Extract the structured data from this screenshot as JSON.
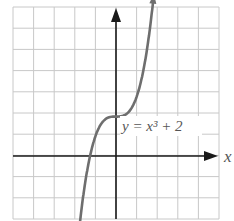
{
  "chart_data": {
    "type": "line",
    "title": "",
    "xlabel": "x",
    "ylabel": "",
    "equation_label": "y = x³ + 2",
    "grid": true,
    "xlim": [
      -5,
      5
    ],
    "ylim": [
      -3,
      7
    ],
    "series": [
      {
        "name": "y = x^3 + 2",
        "x": [
          -1.95,
          -1.5,
          -1.26,
          -1.0,
          -0.5,
          0.0,
          0.5,
          1.0,
          1.5,
          1.9
        ],
        "y": [
          -5.41,
          -1.38,
          0.0,
          1.0,
          1.88,
          2.0,
          2.13,
          3.0,
          5.38,
          8.86
        ]
      }
    ],
    "colors": {
      "grid": "#c8c8c8",
      "axes": "#1a1a1a",
      "curve": "#6e6e6e",
      "label": "#555555"
    }
  }
}
